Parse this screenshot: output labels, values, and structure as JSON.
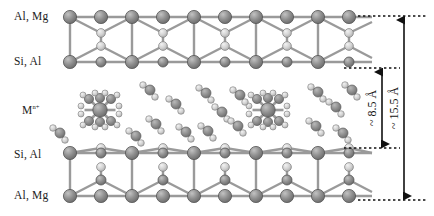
{
  "figure": {
    "type": "clay-mineral-interlayer-schematic",
    "background": "#ffffff",
    "width": 434,
    "height": 216
  },
  "labels": {
    "sheet_top_octahedral": "Al, Mg",
    "sheet_top_tetrahedral": "Si, Al",
    "interlayer_cation": "M",
    "interlayer_cation_charge": "n+",
    "sheet_bottom_tetrahedral": "Si, Al",
    "sheet_bottom_octahedral": "Al, Mg"
  },
  "dimensions": {
    "interlayer": {
      "text": "~ 8.5 Å",
      "value": 8.5,
      "unit": "Å",
      "approx": true
    },
    "basal_spacing": {
      "text": "~ 15.5 Å",
      "value": 15.5,
      "unit": "Å",
      "approx": true
    }
  },
  "colors": {
    "metal_sphere": "#8e8e8e",
    "metal_sphere_dark": "#6f6f6f",
    "oxygen_sphere": "#cfcfcf",
    "oxygen_sphere_light": "#e6e6e6",
    "bond": "#8a8a8a",
    "outline": "#5e5e5e",
    "annotation": "#111111"
  },
  "structure": {
    "top_sheet_rows": [
      "octahedral-cations",
      "apical-oxygens",
      "basal-oxygens"
    ],
    "bottom_sheet_rows": [
      "basal-oxygens",
      "apical-oxygens",
      "octahedral-cations"
    ],
    "interlayer_species": [
      "hydrated-cation-octahedron",
      "water-molecule"
    ],
    "hydrated_cation_count": 2,
    "coordination_number": 6
  }
}
